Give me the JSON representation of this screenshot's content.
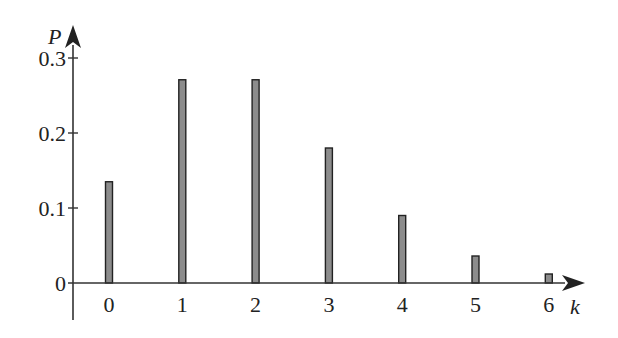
{
  "chart_data": {
    "type": "bar",
    "title": "",
    "xlabel": "k",
    "ylabel": "P",
    "categories": [
      "0",
      "1",
      "2",
      "3",
      "4",
      "5",
      "6"
    ],
    "values": [
      0.135,
      0.271,
      0.271,
      0.18,
      0.09,
      0.036,
      0.012
    ],
    "yticks": [
      "0",
      "0.1",
      "0.2",
      "0.3"
    ],
    "ylim": [
      0,
      0.3
    ],
    "grid": false,
    "legend": null,
    "bar_color": "#8c8c8c",
    "bar_edge_color": "#222222",
    "axis_color": "#333333"
  }
}
